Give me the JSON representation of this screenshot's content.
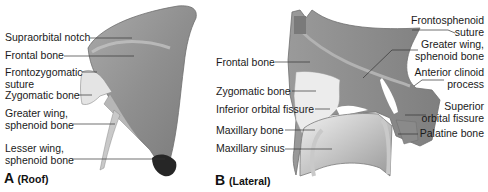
{
  "figure": {
    "panels": [
      {
        "id": "A",
        "view": "(Roof)",
        "labels": [
          {
            "text": "Supraorbital notch"
          },
          {
            "text": "Frontal bone"
          },
          {
            "text": "Frontozygomatic",
            "text2": "suture"
          },
          {
            "text": "Zygomatic bone"
          },
          {
            "text": "Greater wing,",
            "text2": "sphenoid bone"
          },
          {
            "text": "Lesser wing,",
            "text2": "sphenoid bone"
          }
        ]
      },
      {
        "id": "B",
        "view": "(Lateral)",
        "labels_left": [
          {
            "text": "Frontal bone"
          },
          {
            "text": "Zygomatic bone"
          },
          {
            "text": "Inferior orbital fissure"
          },
          {
            "text": "Maxillary bone"
          },
          {
            "text": "Maxillary sinus"
          }
        ],
        "labels_right": [
          {
            "text": "Frontosphenoid",
            "text2": "suture"
          },
          {
            "text": "Greater wing,",
            "text2": "sphenoid bone"
          },
          {
            "text": "Anterior clinoid",
            "text2": "process"
          },
          {
            "text": "Superior",
            "text2": "orbital fissure"
          },
          {
            "text": "Palatine bone"
          }
        ]
      }
    ],
    "colors": {
      "bone_mid": "#8e8e8e",
      "bone_light": "#b9b9b9",
      "bone_pale": "#e6e6e6",
      "bone_dark": "#2a2a2a",
      "leader": "#333333"
    }
  }
}
